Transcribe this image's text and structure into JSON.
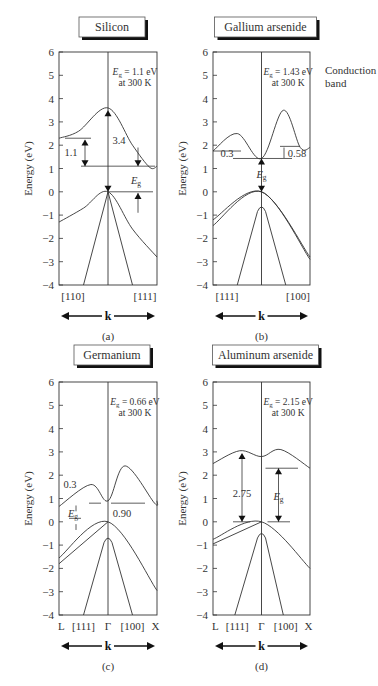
{
  "side_note": {
    "line1": "Conduction",
    "line2": "band"
  },
  "chart_data": [
    {
      "type": "line",
      "panel": "(a)",
      "title": "Silicon",
      "gap_label": "E_g = 1.1 eV",
      "temp_label": "at 300 K",
      "ylabel": "Energy (eV)",
      "ylim": [
        -4,
        6
      ],
      "yticks": [
        -4,
        -3,
        -2,
        -1,
        0,
        1,
        2,
        3,
        4,
        5,
        6
      ],
      "xticks": [
        "[110]",
        "[111]"
      ],
      "xlabel": "k",
      "annotations": [
        "1.1",
        "3.4",
        "E_g"
      ],
      "series": [
        {
          "name": "conduction band",
          "points": [
            [
              -1,
              2.3
            ],
            [
              -0.6,
              2.6
            ],
            [
              0,
              3.6
            ],
            [
              0.5,
              2.0
            ],
            [
              0.85,
              1.05
            ],
            [
              1,
              1.1
            ]
          ]
        },
        {
          "name": "heavy hole valence band",
          "points": [
            [
              -1,
              -1.3
            ],
            [
              -0.5,
              -0.7
            ],
            [
              0,
              0
            ],
            [
              0.5,
              -1.6
            ],
            [
              1,
              -2.8
            ]
          ]
        },
        {
          "name": "light hole band left",
          "points": [
            [
              0,
              0
            ],
            [
              -0.5,
              -4
            ]
          ]
        },
        {
          "name": "light hole band right",
          "points": [
            [
              0,
              0
            ],
            [
              0.5,
              -4
            ]
          ]
        }
      ]
    },
    {
      "type": "line",
      "panel": "(b)",
      "title": "Gallium arsenide",
      "gap_label": "E_g = 1.43 eV",
      "temp_label": "at 300 K",
      "ylabel": "Energy (eV)",
      "ylim": [
        -4,
        6
      ],
      "yticks": [
        -4,
        -3,
        -2,
        -1,
        0,
        1,
        2,
        3,
        4,
        5,
        6
      ],
      "xticks": [
        "[111]",
        "[100]"
      ],
      "xlabel": "k",
      "annotations": [
        "0.3",
        "0.58",
        "E_g"
      ],
      "series": [
        {
          "name": "conduction band",
          "points": [
            [
              -1,
              1.75
            ],
            [
              -0.5,
              2.5
            ],
            [
              0,
              1.43
            ],
            [
              0.45,
              3.5
            ],
            [
              0.8,
              1.9
            ],
            [
              1,
              1.9
            ]
          ]
        },
        {
          "name": "valence band upper",
          "points": [
            [
              -1,
              -1.2
            ],
            [
              0,
              0
            ],
            [
              1,
              -2.8
            ]
          ]
        },
        {
          "name": "valence band lower",
          "points": [
            [
              -1,
              -1.45
            ],
            [
              0,
              0
            ],
            [
              1,
              -2.9
            ]
          ]
        },
        {
          "name": "split-off band",
          "points": [
            [
              -0.5,
              -4
            ],
            [
              0,
              -0.5
            ],
            [
              0.5,
              -4
            ]
          ]
        }
      ]
    },
    {
      "type": "line",
      "panel": "(c)",
      "title": "Germanium",
      "gap_label": "E_g = 0.66 eV",
      "temp_label": "at 300 K",
      "ylabel": "Energy (eV)",
      "ylim": [
        -4,
        6
      ],
      "yticks": [
        -4,
        -3,
        -2,
        -1,
        0,
        1,
        2,
        3,
        4,
        5,
        6
      ],
      "xticks": [
        "L",
        "[111]",
        "Γ",
        "[100]",
        "X"
      ],
      "xlabel": "k",
      "annotations": [
        "0.3",
        "0.90",
        "E_g"
      ],
      "series": [
        {
          "name": "conduction band",
          "points": [
            [
              -1,
              0.66
            ],
            [
              -0.35,
              1.6
            ],
            [
              0,
              0.9
            ],
            [
              0.35,
              2.4
            ],
            [
              0.95,
              0.8
            ],
            [
              1,
              0.9
            ]
          ]
        },
        {
          "name": "valence band upper",
          "points": [
            [
              -1,
              -1.55
            ],
            [
              0,
              0
            ],
            [
              1,
              -2.95
            ]
          ]
        },
        {
          "name": "valence band lower",
          "points": [
            [
              -1,
              -1.8
            ],
            [
              0,
              0
            ]
          ]
        },
        {
          "name": "split-off band",
          "points": [
            [
              -0.5,
              -4
            ],
            [
              0,
              -0.55
            ],
            [
              0.5,
              -4
            ]
          ]
        }
      ]
    },
    {
      "type": "line",
      "panel": "(d)",
      "title": "Aluminum arsenide",
      "gap_label": "E_g = 2.15 eV",
      "temp_label": "at 300 K",
      "ylabel": "Energy (eV)",
      "ylim": [
        -4,
        6
      ],
      "yticks": [
        -4,
        -3,
        -2,
        -1,
        0,
        1,
        2,
        3,
        4,
        5,
        6
      ],
      "xticks": [
        "L",
        "[111]",
        "Γ",
        "[100]",
        "X"
      ],
      "xlabel": "k",
      "annotations": [
        "2.75",
        "E_g"
      ],
      "series": [
        {
          "name": "conduction band",
          "points": [
            [
              -1,
              2.5
            ],
            [
              -0.45,
              3.05
            ],
            [
              0,
              2.8
            ],
            [
              0.4,
              3.1
            ],
            [
              1,
              2.3
            ]
          ]
        },
        {
          "name": "valence band upper",
          "points": [
            [
              -1,
              -0.75
            ],
            [
              0,
              0
            ],
            [
              1,
              -2.0
            ]
          ]
        },
        {
          "name": "valence band lower",
          "points": [
            [
              -1,
              -0.95
            ],
            [
              0,
              0
            ]
          ]
        },
        {
          "name": "split-off band",
          "points": [
            [
              -0.55,
              -4
            ],
            [
              0,
              -0.35
            ],
            [
              0.45,
              -4
            ]
          ]
        }
      ]
    }
  ]
}
